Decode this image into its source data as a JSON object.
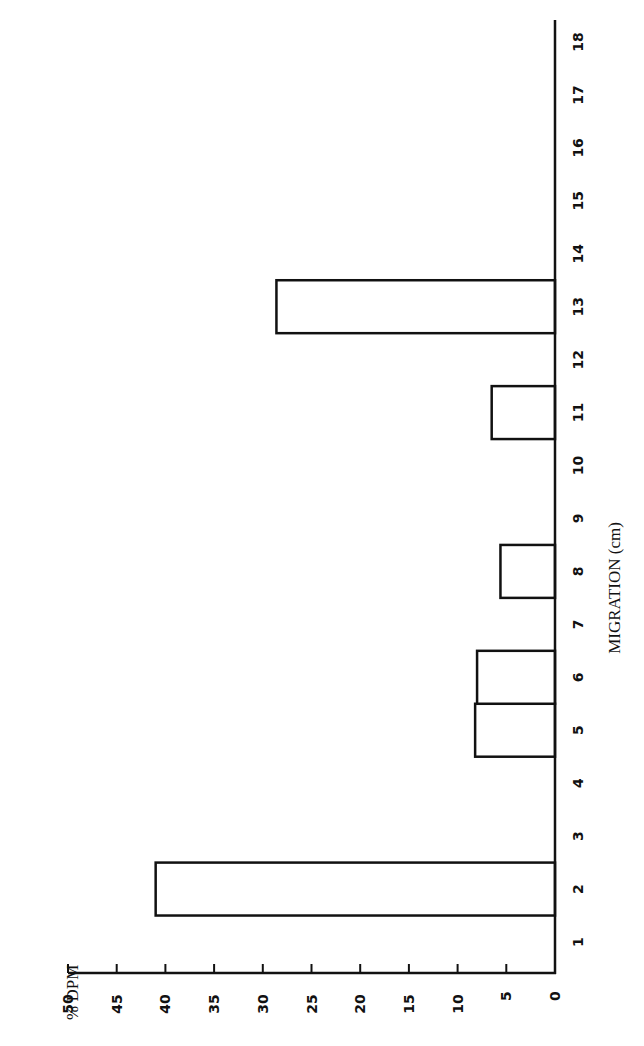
{
  "chart_data": {
    "type": "bar",
    "orientation": "rotated-90-clockwise",
    "title": "",
    "xlabel": "MIGRATION (cm)",
    "ylabel": "% DPM",
    "categories": [
      "1",
      "2",
      "3",
      "4",
      "5",
      "6",
      "7",
      "8",
      "9",
      "10",
      "11",
      "12",
      "13",
      "14",
      "15",
      "16",
      "17",
      "18"
    ],
    "values": [
      0,
      41,
      0,
      0,
      8.2,
      8,
      0,
      5.6,
      0,
      0,
      6.5,
      0,
      28.6,
      0,
      0,
      0,
      0,
      0
    ],
    "ylim": [
      0,
      50
    ],
    "yticks": [
      "0",
      "5",
      "10",
      "15",
      "20",
      "25",
      "30",
      "35",
      "40",
      "45",
      "50"
    ],
    "grid": false,
    "legend": null,
    "bar_style": {
      "fill": "#ffffff",
      "stroke": "#111111"
    }
  }
}
